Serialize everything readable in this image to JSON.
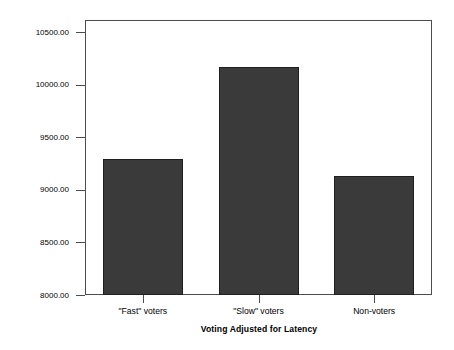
{
  "chart_data": {
    "type": "bar",
    "title": "",
    "subtitle": "",
    "xlabel": "Voting Adjusted for Latency",
    "ylabel": "Understand Issues (Latency to Respond msec)",
    "categories": [
      "\"Fast\" voters",
      "\"Slow\" voters",
      "Non-voters"
    ],
    "values": [
      9293,
      10167,
      9131
    ],
    "ylim": [
      8000,
      10500
    ],
    "ytick_labels": [
      "10500.00",
      "10000.00",
      "9500.00",
      "9000.00",
      "8500.00",
      "8000.00"
    ],
    "ytick_values": [
      10500,
      10000,
      9500,
      9000,
      8500,
      8000
    ],
    "grid": false,
    "legend": "none",
    "bar_color": "#3a3a3a",
    "bar_edge_color": "#1f1f1f",
    "frame_color": "#4d4d4d",
    "background_color": "#ffffff"
  }
}
